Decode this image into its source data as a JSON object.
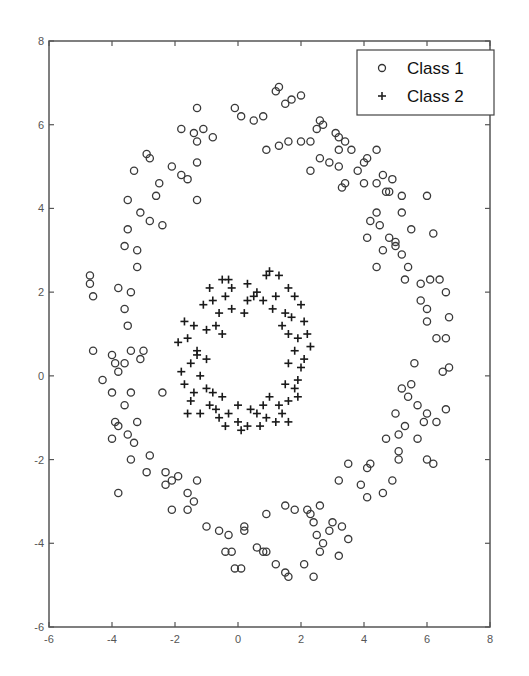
{
  "chart_data": {
    "type": "scatter",
    "title": "",
    "xlabel": "",
    "ylabel": "",
    "xlim": [
      -6,
      8
    ],
    "ylim": [
      -6,
      8
    ],
    "xticks": [
      -6,
      -4,
      -2,
      0,
      2,
      4,
      6,
      8
    ],
    "yticks": [
      -6,
      -4,
      -2,
      0,
      2,
      4,
      6,
      8
    ],
    "grid": false,
    "legend_position": "upper right",
    "series": [
      {
        "name": "Class 1",
        "marker": "circle",
        "points": [
          [
            -1.3,
            6.4
          ],
          [
            -0.1,
            6.4
          ],
          [
            0.1,
            6.2
          ],
          [
            0.5,
            6.1
          ],
          [
            0.8,
            6.2
          ],
          [
            1.2,
            6.8
          ],
          [
            1.3,
            6.9
          ],
          [
            1.5,
            6.5
          ],
          [
            1.7,
            6.6
          ],
          [
            2.0,
            6.7
          ],
          [
            -1.8,
            5.9
          ],
          [
            -1.4,
            5.8
          ],
          [
            -1.3,
            5.6
          ],
          [
            -1.1,
            5.9
          ],
          [
            -0.8,
            5.7
          ],
          [
            -1.3,
            5.1
          ],
          [
            -2.9,
            5.3
          ],
          [
            -2.8,
            5.2
          ],
          [
            -2.1,
            5.0
          ],
          [
            -1.6,
            4.7
          ],
          [
            -1.3,
            4.2
          ],
          [
            -1.8,
            4.8
          ],
          [
            -3.3,
            4.9
          ],
          [
            -2.5,
            4.6
          ],
          [
            -2.6,
            4.3
          ],
          [
            -2.8,
            3.7
          ],
          [
            -2.4,
            3.6
          ],
          [
            -3.5,
            4.2
          ],
          [
            -3.5,
            3.5
          ],
          [
            -3.1,
            3.9
          ],
          [
            -3.6,
            3.1
          ],
          [
            -3.2,
            3.0
          ],
          [
            -3.2,
            2.6
          ],
          [
            -4.7,
            2.4
          ],
          [
            -4.7,
            2.2
          ],
          [
            -4.6,
            1.9
          ],
          [
            -3.8,
            2.1
          ],
          [
            -3.4,
            2.0
          ],
          [
            -3.6,
            1.6
          ],
          [
            -3.5,
            1.2
          ],
          [
            -4.0,
            0.5
          ],
          [
            -3.6,
            0.3
          ],
          [
            -3.4,
            0.6
          ],
          [
            -3.0,
            0.6
          ],
          [
            -3.1,
            0.4
          ],
          [
            -4.6,
            0.6
          ],
          [
            -3.9,
            0.3
          ],
          [
            -3.8,
            0.1
          ],
          [
            -2.4,
            -0.4
          ],
          [
            -4.0,
            -0.4
          ],
          [
            -3.4,
            -0.4
          ],
          [
            -4.3,
            -0.1
          ],
          [
            -3.6,
            -0.7
          ],
          [
            -3.9,
            -1.1
          ],
          [
            -3.8,
            -1.2
          ],
          [
            -3.2,
            -1.1
          ],
          [
            -3.5,
            -1.4
          ],
          [
            -4.0,
            -1.5
          ],
          [
            -3.3,
            -1.6
          ],
          [
            -2.8,
            -1.9
          ],
          [
            -3.4,
            -2.0
          ],
          [
            -3.8,
            -2.8
          ],
          [
            -2.9,
            -2.3
          ],
          [
            -2.3,
            -2.3
          ],
          [
            -2.1,
            -2.5
          ],
          [
            -1.9,
            -2.4
          ],
          [
            -2.3,
            -2.6
          ],
          [
            -1.6,
            -2.8
          ],
          [
            -1.3,
            -2.5
          ],
          [
            -2.1,
            -3.2
          ],
          [
            -1.6,
            -3.2
          ],
          [
            -1.4,
            -3.0
          ],
          [
            -1.0,
            -3.6
          ],
          [
            -0.6,
            -3.7
          ],
          [
            -0.3,
            -3.8
          ],
          [
            -0.2,
            -4.2
          ],
          [
            0.2,
            -3.7
          ],
          [
            0.2,
            -3.6
          ],
          [
            -0.4,
            -4.2
          ],
          [
            0.1,
            -4.6
          ],
          [
            -0.1,
            -4.6
          ],
          [
            0.6,
            -4.1
          ],
          [
            0.9,
            -4.2
          ],
          [
            0.8,
            -4.2
          ],
          [
            1.2,
            -4.5
          ],
          [
            1.5,
            -4.7
          ],
          [
            1.6,
            -4.8
          ],
          [
            2.1,
            -4.5
          ],
          [
            2.4,
            -4.8
          ],
          [
            2.6,
            -4.2
          ],
          [
            2.2,
            -3.2
          ],
          [
            2.4,
            -3.5
          ],
          [
            2.3,
            -3.3
          ],
          [
            2.6,
            -3.1
          ],
          [
            2.5,
            -3.8
          ],
          [
            2.9,
            -3.7
          ],
          [
            3.0,
            -3.5
          ],
          [
            3.3,
            -3.6
          ],
          [
            3.5,
            -3.9
          ],
          [
            3.2,
            -4.3
          ],
          [
            1.8,
            -3.2
          ],
          [
            1.5,
            -3.1
          ],
          [
            0.9,
            -3.3
          ],
          [
            2.7,
            -4.0
          ],
          [
            3.2,
            -2.5
          ],
          [
            3.5,
            -2.1
          ],
          [
            4.2,
            -2.1
          ],
          [
            4.1,
            -2.2
          ],
          [
            3.9,
            -2.6
          ],
          [
            4.1,
            -2.9
          ],
          [
            4.9,
            -2.5
          ],
          [
            4.6,
            -2.8
          ],
          [
            5.1,
            -2.0
          ],
          [
            5.1,
            -1.8
          ],
          [
            4.7,
            -1.5
          ],
          [
            5.1,
            -1.4
          ],
          [
            5.3,
            -1.2
          ],
          [
            5.0,
            -0.9
          ],
          [
            5.7,
            -1.5
          ],
          [
            6.0,
            -2.0
          ],
          [
            6.2,
            -2.1
          ],
          [
            5.9,
            -1.1
          ],
          [
            6.0,
            -0.9
          ],
          [
            5.7,
            -0.7
          ],
          [
            6.3,
            -1.1
          ],
          [
            6.6,
            -0.8
          ],
          [
            5.2,
            -0.3
          ],
          [
            5.5,
            -0.2
          ],
          [
            5.6,
            0.3
          ],
          [
            5.4,
            -0.5
          ],
          [
            6.5,
            0.1
          ],
          [
            6.7,
            0.2
          ],
          [
            6.6,
            0.9
          ],
          [
            6.0,
            1.3
          ],
          [
            6.3,
            0.9
          ],
          [
            6.7,
            1.4
          ],
          [
            6.0,
            1.6
          ],
          [
            5.8,
            1.8
          ],
          [
            6.6,
            2.0
          ],
          [
            5.8,
            2.2
          ],
          [
            6.1,
            2.3
          ],
          [
            6.4,
            2.3
          ],
          [
            5.4,
            2.6
          ],
          [
            5.2,
            2.9
          ],
          [
            4.6,
            3.0
          ],
          [
            4.8,
            3.3
          ],
          [
            5.0,
            3.1
          ],
          [
            6.2,
            3.4
          ],
          [
            5.5,
            3.5
          ],
          [
            5.0,
            3.2
          ],
          [
            4.2,
            3.7
          ],
          [
            4.4,
            3.9
          ],
          [
            5.2,
            3.9
          ],
          [
            5.2,
            4.3
          ],
          [
            6.0,
            4.3
          ],
          [
            4.7,
            4.4
          ],
          [
            4.8,
            4.4
          ],
          [
            4.4,
            4.6
          ],
          [
            4.0,
            4.6
          ],
          [
            3.4,
            4.6
          ],
          [
            3.3,
            4.5
          ],
          [
            3.8,
            4.9
          ],
          [
            4.1,
            5.2
          ],
          [
            3.6,
            5.4
          ],
          [
            3.2,
            5.0
          ],
          [
            3.2,
            5.4
          ],
          [
            3.4,
            5.6
          ],
          [
            4.0,
            5.1
          ],
          [
            4.4,
            5.4
          ],
          [
            4.9,
            4.7
          ],
          [
            2.9,
            5.1
          ],
          [
            2.6,
            5.2
          ],
          [
            2.3,
            5.6
          ],
          [
            2.0,
            5.6
          ],
          [
            1.6,
            5.6
          ],
          [
            1.3,
            5.5
          ],
          [
            0.9,
            5.4
          ],
          [
            2.6,
            6.1
          ],
          [
            2.5,
            5.9
          ],
          [
            2.7,
            6.0
          ],
          [
            3.1,
            5.8
          ],
          [
            3.2,
            5.7
          ],
          [
            2.3,
            4.9
          ],
          [
            4.4,
            2.6
          ],
          [
            4.1,
            3.3
          ],
          [
            5.3,
            2.3
          ],
          [
            4.5,
            3.6
          ],
          [
            4.6,
            4.8
          ]
        ]
      },
      {
        "name": "Class 2",
        "marker": "plus",
        "points": [
          [
            -0.9,
            2.1
          ],
          [
            -0.5,
            2.3
          ],
          [
            -0.3,
            2.3
          ],
          [
            0.3,
            2.2
          ],
          [
            0.6,
            2.0
          ],
          [
            0.9,
            2.4
          ],
          [
            1.0,
            2.5
          ],
          [
            1.3,
            2.4
          ],
          [
            1.6,
            2.1
          ],
          [
            1.8,
            1.9
          ],
          [
            -1.1,
            1.7
          ],
          [
            -0.8,
            1.8
          ],
          [
            -0.6,
            1.5
          ],
          [
            -0.4,
            1.9
          ],
          [
            0.3,
            1.8
          ],
          [
            0.5,
            1.9
          ],
          [
            0.8,
            1.8
          ],
          [
            1.1,
            1.6
          ],
          [
            1.5,
            1.5
          ],
          [
            1.7,
            1.4
          ],
          [
            -1.7,
            1.3
          ],
          [
            -1.4,
            1.2
          ],
          [
            -1.0,
            1.1
          ],
          [
            -0.7,
            1.2
          ],
          [
            -0.5,
            1.0
          ],
          [
            1.4,
            1.2
          ],
          [
            1.6,
            1.0
          ],
          [
            1.9,
            0.9
          ],
          [
            2.1,
            1.3
          ],
          [
            2.2,
            1.0
          ],
          [
            -1.9,
            0.8
          ],
          [
            -1.6,
            0.9
          ],
          [
            -1.3,
            0.6
          ],
          [
            -1.5,
            0.3
          ],
          [
            -1.8,
            0.1
          ],
          [
            1.8,
            0.6
          ],
          [
            2.1,
            0.4
          ],
          [
            2.3,
            0.7
          ],
          [
            2.0,
            0.2
          ],
          [
            1.6,
            0.3
          ],
          [
            -1.7,
            -0.2
          ],
          [
            -1.4,
            -0.4
          ],
          [
            -1.2,
            0.0
          ],
          [
            -1.5,
            -0.6
          ],
          [
            -1.0,
            -0.3
          ],
          [
            1.5,
            -0.2
          ],
          [
            1.8,
            -0.3
          ],
          [
            1.9,
            -0.5
          ],
          [
            1.6,
            -0.6
          ],
          [
            1.3,
            -0.7
          ],
          [
            -1.2,
            -0.9
          ],
          [
            -0.9,
            -0.7
          ],
          [
            -0.6,
            -1.0
          ],
          [
            -0.3,
            -0.9
          ],
          [
            0.0,
            -1.1
          ],
          [
            0.3,
            -1.2
          ],
          [
            0.6,
            -0.9
          ],
          [
            0.9,
            -1.0
          ],
          [
            1.2,
            -1.1
          ],
          [
            1.6,
            -1.1
          ],
          [
            -0.4,
            -1.2
          ],
          [
            0.1,
            -1.3
          ],
          [
            0.4,
            -0.8
          ],
          [
            0.8,
            -0.7
          ],
          [
            1.0,
            -0.5
          ],
          [
            -0.8,
            -0.4
          ],
          [
            -1.3,
            0.5
          ],
          [
            -0.2,
            1.6
          ],
          [
            0.2,
            1.5
          ],
          [
            1.2,
            1.9
          ],
          [
            -1.0,
            0.4
          ],
          [
            -1.6,
            -0.9
          ],
          [
            -0.7,
            -0.8
          ],
          [
            0.7,
            -1.2
          ],
          [
            1.4,
            -0.9
          ],
          [
            1.9,
            -0.1
          ],
          [
            2.0,
            1.7
          ],
          [
            -0.2,
            2.1
          ],
          [
            0.0,
            -0.7
          ],
          [
            -0.5,
            -0.5
          ]
        ]
      }
    ]
  },
  "legend": {
    "items": [
      {
        "label": "Class 1",
        "marker": "circle"
      },
      {
        "label": "Class 2",
        "marker": "plus"
      }
    ]
  },
  "axes": {
    "x_tick_labels": [
      "-6",
      "-4",
      "-2",
      "0",
      "2",
      "4",
      "6",
      "8"
    ],
    "y_tick_labels": [
      "-6",
      "-4",
      "-2",
      "0",
      "2",
      "4",
      "6",
      "8"
    ]
  },
  "colors": {
    "axis": "#555555",
    "marker": "#333333",
    "background": "#ffffff"
  }
}
